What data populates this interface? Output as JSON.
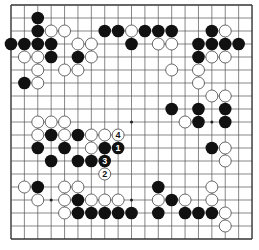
{
  "board": {
    "size": 19,
    "origin_x": 11,
    "origin_y": 5,
    "step_x": 13.39,
    "step_y": 13.0,
    "stone_radius": 6.3,
    "line_color": "#555555",
    "edge_color": "#333333",
    "black_color": "#111111",
    "white_fill": "#ffffff",
    "white_stroke": "#444444",
    "star_points": [
      [
        3,
        3
      ],
      [
        9,
        3
      ],
      [
        15,
        3
      ],
      [
        3,
        9
      ],
      [
        9,
        9
      ],
      [
        15,
        9
      ],
      [
        3,
        15
      ],
      [
        9,
        15
      ],
      [
        15,
        15
      ]
    ]
  },
  "stones": {
    "black": [
      [
        2,
        1
      ],
      [
        2,
        2
      ],
      [
        7,
        2
      ],
      [
        8,
        2
      ],
      [
        10,
        2
      ],
      [
        11,
        2
      ],
      [
        12,
        2
      ],
      [
        15,
        2
      ],
      [
        0,
        3
      ],
      [
        1,
        3
      ],
      [
        2,
        3
      ],
      [
        3,
        3
      ],
      [
        9,
        3
      ],
      [
        14,
        3
      ],
      [
        15,
        3
      ],
      [
        16,
        3
      ],
      [
        17,
        3
      ],
      [
        3,
        4
      ],
      [
        5,
        4
      ],
      [
        14,
        4
      ],
      [
        1,
        6
      ],
      [
        12,
        8
      ],
      [
        14,
        8
      ],
      [
        16,
        8
      ],
      [
        14,
        9
      ],
      [
        16,
        9
      ],
      [
        3,
        10
      ],
      [
        5,
        10
      ],
      [
        2,
        11
      ],
      [
        4,
        11
      ],
      [
        7,
        11
      ],
      [
        15,
        11
      ],
      [
        3,
        12
      ],
      [
        5,
        12
      ],
      [
        6,
        12
      ],
      [
        2,
        14
      ],
      [
        11,
        14
      ],
      [
        5,
        15
      ],
      [
        12,
        15
      ],
      [
        5,
        16
      ],
      [
        6,
        16
      ],
      [
        7,
        16
      ],
      [
        8,
        16
      ],
      [
        9,
        16
      ],
      [
        11,
        16
      ],
      [
        13,
        16
      ],
      [
        14,
        16
      ],
      [
        15,
        16
      ]
    ],
    "white": [
      [
        3,
        2
      ],
      [
        4,
        2
      ],
      [
        9,
        2
      ],
      [
        16,
        2
      ],
      [
        5,
        3
      ],
      [
        6,
        3
      ],
      [
        11,
        3
      ],
      [
        12,
        3
      ],
      [
        1,
        4
      ],
      [
        2,
        4
      ],
      [
        6,
        4
      ],
      [
        15,
        4
      ],
      [
        16,
        4
      ],
      [
        2,
        5
      ],
      [
        4,
        5
      ],
      [
        5,
        5
      ],
      [
        12,
        5
      ],
      [
        14,
        5
      ],
      [
        2,
        6
      ],
      [
        14,
        6
      ],
      [
        15,
        7
      ],
      [
        16,
        7
      ],
      [
        2,
        9
      ],
      [
        3,
        9
      ],
      [
        4,
        9
      ],
      [
        13,
        9
      ],
      [
        2,
        10
      ],
      [
        4,
        10
      ],
      [
        6,
        10
      ],
      [
        7,
        10
      ],
      [
        6,
        11
      ],
      [
        16,
        11
      ],
      [
        16,
        12
      ],
      [
        1,
        14
      ],
      [
        4,
        14
      ],
      [
        5,
        14
      ],
      [
        15,
        14
      ],
      [
        2,
        15
      ],
      [
        4,
        15
      ],
      [
        6,
        15
      ],
      [
        7,
        15
      ],
      [
        8,
        15
      ],
      [
        11,
        15
      ],
      [
        13,
        15
      ],
      [
        15,
        15
      ],
      [
        4,
        16
      ],
      [
        16,
        16
      ],
      [
        16,
        17
      ]
    ]
  },
  "moves": [
    {
      "number": "1",
      "color": "black",
      "col": 8,
      "row": 11
    },
    {
      "number": "2",
      "color": "white",
      "col": 7,
      "row": 13
    },
    {
      "number": "3",
      "color": "black",
      "col": 7,
      "row": 12
    },
    {
      "number": "4",
      "color": "white",
      "col": 8,
      "row": 10
    }
  ]
}
